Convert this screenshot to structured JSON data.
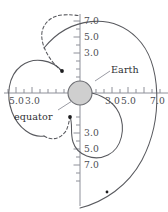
{
  "figure": {
    "type": "polar-trajectory-diagram",
    "background_color": "#ffffff",
    "curve_color": "#58595e",
    "axis_color": "#8e9099",
    "earth_fill_color": "#cfcfcf",
    "earth_stroke_color": "#6d6e73"
  },
  "annotations": {
    "earth_label": "Earth",
    "equator_label": "equator"
  },
  "axes": {
    "x_axis": {
      "orientation": "horizontal",
      "center_px": 80,
      "unit_px": 8,
      "left_labels": [
        "5.0",
        "3.0"
      ],
      "right_labels": [
        "3.0",
        "5.0",
        "7.0"
      ],
      "left_label_values": [
        5.0,
        3.0
      ],
      "right_label_values": [
        3.0,
        5.0,
        7.0
      ],
      "tick_count_left": 10,
      "tick_count_right": 11
    },
    "y_axis": {
      "orientation": "vertical",
      "center_px": 93,
      "unit_px": 8,
      "upper_labels": [
        "7.0",
        "5.0",
        "3.0"
      ],
      "lower_labels": [
        "3.0",
        "5.0",
        "7.0"
      ],
      "upper_label_values": [
        7.0,
        5.0,
        3.0
      ],
      "lower_label_values": [
        3.0,
        5.0,
        7.0
      ]
    }
  },
  "tick_labels": {
    "y_top_7": "7.0",
    "y_top_5": "5.0",
    "y_top_3": "3.0",
    "y_bot_3": "3.0",
    "y_bot_5": "5.0",
    "y_bot_7": "7.0",
    "x_left_5": "5.0",
    "x_left_3": "3.0",
    "x_right_3": "3.0",
    "x_right_5": "5.0",
    "x_right_7": "7.0"
  },
  "earth": {
    "center_x": 80,
    "center_y": 93,
    "radius": 12,
    "label": "Earth"
  },
  "curves": [
    {
      "name": "outer-field-line",
      "style": "solid"
    },
    {
      "name": "left-lobe-solid",
      "style": "solid"
    },
    {
      "name": "left-lobe-dashed-upper",
      "style": "dashed"
    },
    {
      "name": "left-lobe-dashed-lower",
      "style": "dashed"
    },
    {
      "name": "inner-right-loop",
      "style": "solid"
    }
  ],
  "markers": [
    {
      "name": "upper-left-point",
      "x": 62,
      "y": 71
    },
    {
      "name": "lower-left-point",
      "x": 70,
      "y": 117
    },
    {
      "name": "outer-curve-point",
      "x": 107,
      "y": 192
    }
  ]
}
